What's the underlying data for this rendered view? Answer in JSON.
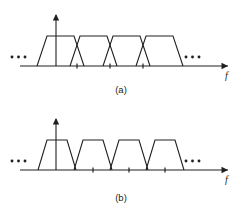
{
  "figure": {
    "background_color": "#ffffff",
    "line_color": "#231f20",
    "width": 242,
    "height": 209
  },
  "panels": [
    {
      "id": "a",
      "caption": "(a)",
      "axis": {
        "x_label": "f",
        "x_axis_y": 66,
        "x_start": 20,
        "x_end": 228,
        "y_axis_x": 56,
        "y_axis_top": 15,
        "has_vertical_arrow": true,
        "has_horizontal_arrow": true
      },
      "description": "overlapping trapezoidal spectral replicas",
      "ellipsis_left": "...",
      "ellipsis_right": "...",
      "ellipsis_left_x": 12,
      "ellipsis_right_x": 186,
      "ellipsis_y": 57,
      "top_y": 36,
      "trapezoids": [
        {
          "base_left": 37,
          "top_left": 47,
          "top_right": 74,
          "base_right": 84
        },
        {
          "base_left": 70,
          "top_left": 80,
          "top_right": 107,
          "base_right": 117
        },
        {
          "base_left": 103,
          "top_left": 113,
          "top_right": 140,
          "base_right": 150
        },
        {
          "base_left": 136,
          "top_left": 146,
          "top_right": 173,
          "base_right": 183
        }
      ],
      "ticks": [
        77,
        110,
        143
      ]
    },
    {
      "id": "b",
      "caption": "(b)",
      "axis": {
        "x_label": "f",
        "x_axis_y": 66,
        "x_start": 20,
        "x_end": 228,
        "y_axis_x": 56,
        "y_axis_top": 15,
        "has_vertical_arrow": true,
        "has_horizontal_arrow": true
      },
      "description": "separated non-overlapping trapezoidal spectral replicas",
      "ellipsis_left": "...",
      "ellipsis_right": "...",
      "ellipsis_left_x": 12,
      "ellipsis_right_x": 186,
      "ellipsis_y": 57,
      "top_y": 36,
      "trapezoids": [
        {
          "base_left": 38,
          "top_left": 47,
          "top_right": 67,
          "base_right": 76
        },
        {
          "base_left": 74,
          "top_left": 83,
          "top_right": 103,
          "base_right": 112
        },
        {
          "base_left": 110,
          "top_left": 119,
          "top_right": 139,
          "base_right": 148
        },
        {
          "base_left": 146,
          "top_left": 155,
          "top_right": 175,
          "base_right": 184
        }
      ],
      "ticks": [
        93,
        129,
        165
      ]
    }
  ]
}
